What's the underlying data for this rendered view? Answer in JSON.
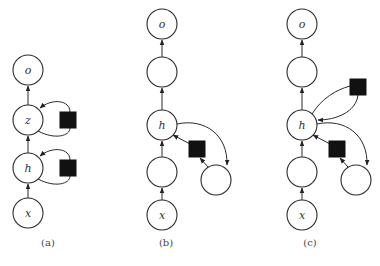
{
  "figure": {
    "panels": [
      {
        "id": "a",
        "caption": "(a)",
        "nodes": [
          {
            "id": "o",
            "label": "o",
            "cx": 28,
            "cy": 70
          },
          {
            "id": "z",
            "label": "z",
            "cx": 28,
            "cy": 120
          },
          {
            "id": "h",
            "label": "h",
            "cx": 28,
            "cy": 168
          },
          {
            "id": "x",
            "label": "x",
            "cx": 28,
            "cy": 213
          }
        ],
        "squares": [
          {
            "id": "delay-z",
            "x": 60,
            "y": 112,
            "size": 16
          },
          {
            "id": "delay-h",
            "x": 60,
            "y": 160,
            "size": 16
          }
        ]
      },
      {
        "id": "b",
        "caption": "(b)",
        "nodes": [
          {
            "id": "o",
            "label": "o",
            "cx": 162,
            "cy": 24
          },
          {
            "id": "n2",
            "label": "",
            "cx": 162,
            "cy": 72
          },
          {
            "id": "h",
            "label": "h",
            "cx": 162,
            "cy": 125
          },
          {
            "id": "n4",
            "label": "",
            "cx": 162,
            "cy": 172
          },
          {
            "id": "x",
            "label": "x",
            "cx": 162,
            "cy": 215
          },
          {
            "id": "side",
            "label": "",
            "cx": 216,
            "cy": 180
          }
        ],
        "squares": [
          {
            "id": "delay",
            "x": 189,
            "y": 141,
            "size": 16
          }
        ]
      },
      {
        "id": "c",
        "caption": "(c)",
        "nodes": [
          {
            "id": "o",
            "label": "o",
            "cx": 302,
            "cy": 24
          },
          {
            "id": "n2",
            "label": "",
            "cx": 302,
            "cy": 72
          },
          {
            "id": "h",
            "label": "h",
            "cx": 302,
            "cy": 125
          },
          {
            "id": "n4",
            "label": "",
            "cx": 302,
            "cy": 172
          },
          {
            "id": "x",
            "label": "x",
            "cx": 302,
            "cy": 215
          },
          {
            "id": "side",
            "label": "",
            "cx": 356,
            "cy": 180
          }
        ],
        "squares": [
          {
            "id": "delay-top",
            "x": 350,
            "y": 79,
            "size": 16
          },
          {
            "id": "delay-bottom",
            "x": 329,
            "y": 141,
            "size": 16
          }
        ]
      }
    ]
  }
}
